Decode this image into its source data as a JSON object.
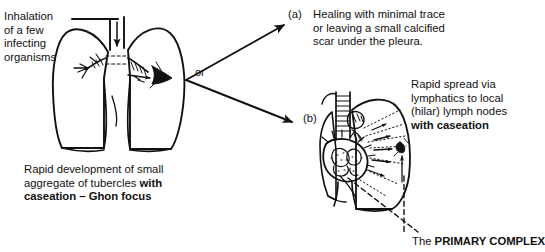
{
  "figure": {
    "background_color": "#ffffff",
    "ink_color": "#111111"
  },
  "labels": {
    "inhalation": "Inhalation\nof a few\ninfecting\norganisms",
    "ghon_focus_plain": "Rapid development of small\naggregate of tubercles ",
    "ghon_focus_bold": "with\ncaseation – Ghon focus",
    "branch_connector": "or",
    "outcome_a_marker": "(a)",
    "outcome_a_text": "Healing with minimal trace\nor leaving a small calcified\nscar under the pleura.",
    "outcome_b_marker": "(b)",
    "outcome_b_plain": "Rapid spread via\nlymphatics to local\n(hilar) lymph nodes\n",
    "outcome_b_bold": "with caseation",
    "primary_complex_plain": "The ",
    "primary_complex_bold": "PRIMARY COMPLEX"
  },
  "diagrams": {
    "left_lung": {
      "name": "lungs-with-ghon-focus",
      "features": [
        "trachea",
        "main-bronchi",
        "inhalation-arrow",
        "ghon-focus-lesion",
        "right-lung",
        "left-lung"
      ]
    },
    "right_lung": {
      "name": "lungs-with-hilar-lymph-nodes",
      "features": [
        "trachea-rings",
        "caseating-hilar-lymph-nodes",
        "lymphatic-spread-arrows",
        "ghon-focus-lesion",
        "primary-complex-pointers"
      ]
    }
  }
}
